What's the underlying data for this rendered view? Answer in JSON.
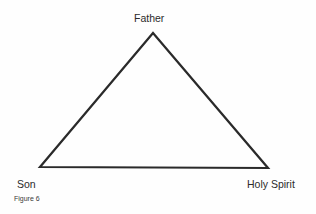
{
  "diagram": {
    "type": "triangle",
    "nodes": [
      {
        "id": "top",
        "label": "Father"
      },
      {
        "id": "bottom-left",
        "label": "Son"
      },
      {
        "id": "bottom-right",
        "label": "Holy Spirit"
      }
    ],
    "edges": [
      {
        "from": "top",
        "to": "bottom-left"
      },
      {
        "from": "bottom-left",
        "to": "bottom-right"
      },
      {
        "from": "bottom-right",
        "to": "top"
      }
    ],
    "stroke_color": "#2a2a2a"
  },
  "caption": "Figure 6"
}
